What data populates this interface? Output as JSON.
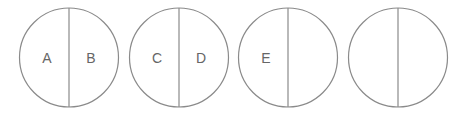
{
  "diagram": {
    "circles": [
      {
        "left_label": "A",
        "right_label": "B"
      },
      {
        "left_label": "C",
        "right_label": "D"
      },
      {
        "left_label": "E",
        "right_label": ""
      },
      {
        "left_label": "",
        "right_label": ""
      }
    ]
  }
}
